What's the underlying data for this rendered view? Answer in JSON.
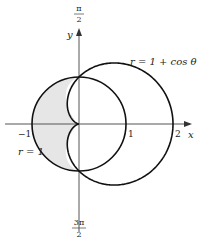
{
  "figure": {
    "type": "polar-region",
    "curves": [
      {
        "name": "circle",
        "equation": "r = 1",
        "label": "r = 1"
      },
      {
        "name": "cardioid",
        "equation": "r = 1 + cos θ",
        "label": "r = 1 + cos θ"
      }
    ],
    "shaded_region": "inside r = 1 and outside r = 1 + cos θ (left side)",
    "colors": {
      "curve": "#111111",
      "axis": "#555555",
      "shade": "#e6e6e6",
      "label": "#222222"
    }
  },
  "axes": {
    "x_label": "x",
    "y_label": "y",
    "x_ticks": [
      "−1",
      "1",
      "2"
    ],
    "angle_top": {
      "num": "π",
      "den": "2"
    },
    "angle_bottom": {
      "num": "3π",
      "den": "2"
    }
  },
  "labels": {
    "circle": "r = 1",
    "cardioid": "r = 1 + cos θ"
  }
}
